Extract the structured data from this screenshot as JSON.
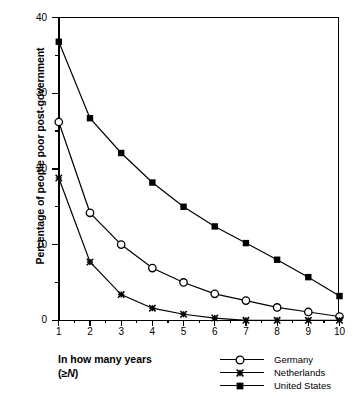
{
  "chart_data": {
    "type": "line",
    "title": "",
    "xlabel": "In how many years (≥ N)",
    "ylabel": "Percentage of people poor post-government",
    "x": [
      1,
      2,
      3,
      4,
      5,
      6,
      7,
      8,
      9,
      10
    ],
    "xlim": [
      1,
      10
    ],
    "ylim": [
      0,
      40
    ],
    "xticks": [
      "1",
      "2",
      "3",
      "4",
      "5",
      "6",
      "7",
      "8",
      "9",
      "10"
    ],
    "yticks": [
      "0",
      "10",
      "20",
      "30",
      "40"
    ],
    "grid": false,
    "legend_position": "bottom-right",
    "series": [
      {
        "name": "Germany",
        "marker": "open-circle",
        "values": [
          26.2,
          14.2,
          10.0,
          6.9,
          5.0,
          3.5,
          2.6,
          1.7,
          1.1,
          0.5
        ]
      },
      {
        "name": "Netherlands",
        "marker": "cross-star",
        "values": [
          18.8,
          7.7,
          3.4,
          1.6,
          0.8,
          0.3,
          0.0,
          0.0,
          0.0,
          0.0
        ]
      },
      {
        "name": "United States",
        "marker": "filled-square",
        "values": [
          36.8,
          26.7,
          22.1,
          18.2,
          15.0,
          12.4,
          10.2,
          8.0,
          5.7,
          3.2
        ]
      }
    ]
  },
  "axis": {
    "x_caption_line1": "In how many years",
    "x_caption_open": "(≥",
    "x_caption_italic": "N",
    "x_caption_close": ")",
    "y_title": "Percentage of people poor post-government"
  },
  "legend": {
    "items": [
      {
        "label": "Germany",
        "marker": "open-circle"
      },
      {
        "label": "Netherlands",
        "marker": "cross-star"
      },
      {
        "label": "United States",
        "marker": "filled-square"
      }
    ]
  },
  "colors": {
    "ink": "#000000",
    "background": "#ffffff"
  }
}
